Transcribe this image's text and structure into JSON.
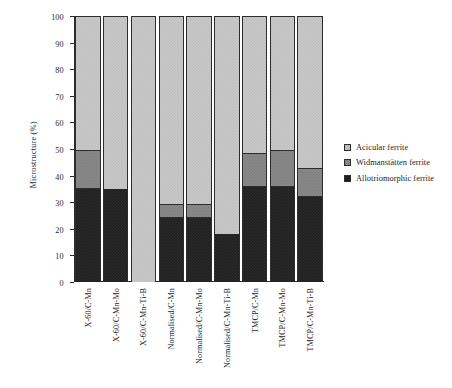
{
  "chart_data": {
    "type": "bar",
    "subtype": "stacked-vertical",
    "title": "",
    "xlabel": "",
    "ylabel": "Microstructure (%)",
    "ylim": [
      0,
      100
    ],
    "yticks": [
      0,
      10,
      20,
      30,
      40,
      50,
      60,
      70,
      80,
      90,
      100
    ],
    "ytick_labels": [
      "0",
      "10",
      "20",
      "30",
      "40",
      "50",
      "60",
      "70",
      "80",
      "90",
      "100"
    ],
    "grid": false,
    "legend_position": "right",
    "categories": [
      "X-60/C-Mn",
      "X-60/C-Mn-Mo",
      "X-60/C-Mn-Ti-B",
      "Normalised/C-Mn",
      "Normalised/C-Mn-Mo",
      "Normalised/C-Mn-Ti-B",
      "TMCP/C-Mn",
      "TMCP/C-Mn-Mo",
      "TMCP/C-Mn-Ti-B"
    ],
    "series": [
      {
        "name": "Allotriomorphic ferrite",
        "key": "allo",
        "color": "#1f1f1f",
        "values": [
          35,
          35,
          0,
          24,
          24,
          18,
          36,
          36,
          32
        ]
      },
      {
        "name": "Widmanstätten ferrite",
        "key": "widman",
        "color": "#8a8a8a",
        "values": [
          15,
          0,
          0,
          5.5,
          5.5,
          0,
          12.5,
          14,
          11
        ]
      },
      {
        "name": "Acicular ferrite",
        "key": "acicular",
        "color": "#c9c9c9",
        "values": [
          50,
          65,
          100,
          70.5,
          70.5,
          82,
          51.5,
          50,
          57
        ]
      }
    ],
    "legend_entries": [
      "Acicular ferrite",
      "Widmanstätten ferrite",
      "Allotriomorphic ferrite"
    ]
  }
}
